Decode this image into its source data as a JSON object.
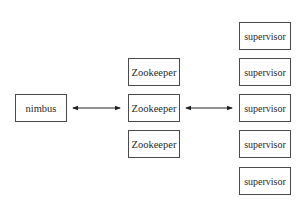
{
  "diagram": {
    "nimbus": {
      "label": "nimbus"
    },
    "zookeepers": [
      {
        "label": "Zookeeper"
      },
      {
        "label": "Zookeeper"
      },
      {
        "label": "Zookeeper"
      }
    ],
    "supervisors": [
      {
        "label": "supervisor"
      },
      {
        "label": "supervisor"
      },
      {
        "label": "supervisor"
      },
      {
        "label": "supervisor"
      },
      {
        "label": "supervisor"
      }
    ],
    "edges": [
      {
        "from": "nimbus",
        "to": "Zookeeper",
        "direction": "bidirectional"
      },
      {
        "from": "Zookeeper",
        "to": "supervisor",
        "direction": "bidirectional"
      }
    ]
  }
}
